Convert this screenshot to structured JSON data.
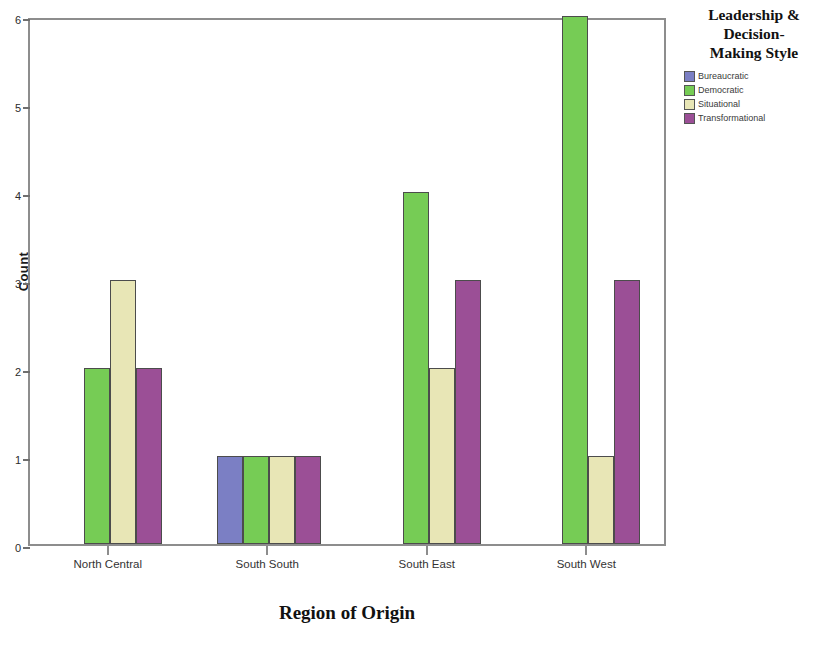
{
  "chart_data": {
    "type": "bar",
    "title": "",
    "xlabel": "Region of Origin",
    "ylabel": "Count",
    "categories": [
      "North Central",
      "South South",
      "South East",
      "South West"
    ],
    "series": [
      {
        "name": "Bureaucratic",
        "color": "#7b7fc4",
        "values": [
          0,
          1,
          0,
          0
        ]
      },
      {
        "name": "Democratic",
        "color": "#76cc55",
        "values": [
          2,
          1,
          4,
          6
        ]
      },
      {
        "name": "Situational",
        "color": "#e8e6b6",
        "values": [
          3,
          1,
          2,
          1
        ]
      },
      {
        "name": "Transformational",
        "color": "#9b4f96",
        "values": [
          2,
          1,
          3,
          3
        ]
      }
    ],
    "ylim": [
      0,
      6
    ],
    "yticks": [
      "0",
      "1",
      "2",
      "3",
      "4",
      "5",
      "6"
    ],
    "grid": false,
    "legend_position": "right",
    "legend_title": "Leadership & Decision-Making Style"
  },
  "legend": {
    "title_lines": [
      "Leadership &",
      "Decision-",
      "Making Style"
    ]
  },
  "colors": {
    "frame": "#8d8d8d",
    "background": "#ffffff",
    "bar_outline": "#4c4c4c"
  }
}
